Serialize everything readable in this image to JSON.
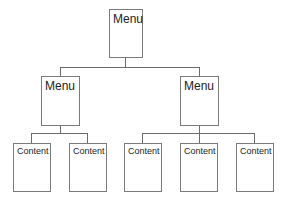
{
  "diagram": {
    "type": "site-hierarchy",
    "root": {
      "label": "Menu"
    },
    "menus": [
      {
        "label": "Menu",
        "children": [
          {
            "label": "Content"
          },
          {
            "label": "Content"
          }
        ]
      },
      {
        "label": "Menu",
        "children": [
          {
            "label": "Content"
          },
          {
            "label": "Content"
          },
          {
            "label": "Content"
          }
        ]
      }
    ],
    "colors": {
      "border": "#7a7a7a",
      "connector": "#6a6a6a",
      "text": "#222222",
      "background": "#ffffff"
    }
  }
}
